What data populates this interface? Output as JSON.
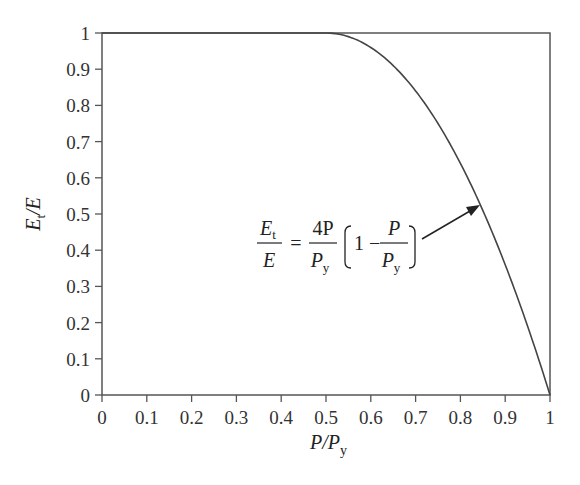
{
  "chart_data": {
    "type": "line",
    "title": "",
    "xlabel": "P/P_y",
    "ylabel": "E_t/E",
    "xlim": [
      0,
      1
    ],
    "ylim": [
      0,
      1
    ],
    "grid": false,
    "x_ticks": [
      "0",
      "0.1",
      "0.2",
      "0.3",
      "0.4",
      "0.5",
      "0.6",
      "0.7",
      "0.8",
      "0.9",
      "1"
    ],
    "y_ticks": [
      "0",
      "0.1",
      "0.2",
      "0.3",
      "0.4",
      "0.5",
      "0.6",
      "0.7",
      "0.8",
      "0.9",
      "1"
    ],
    "series": [
      {
        "name": "E_t/E",
        "x": [
          0,
          0.5,
          0.55,
          0.6,
          0.65,
          0.7,
          0.75,
          0.8,
          0.85,
          0.9,
          0.95,
          1.0
        ],
        "y": [
          1,
          1,
          0.99,
          0.96,
          0.91,
          0.84,
          0.75,
          0.64,
          0.51,
          0.36,
          0.19,
          0
        ]
      }
    ],
    "annotations": [
      {
        "text": "E_t/E = (4P/P_y)(1 - P/P_y)",
        "arrow_to": [
          0.84,
          0.54
        ]
      }
    ],
    "legend": null
  },
  "labels": {
    "xlabel_main": "P/P",
    "xlabel_sub": "y",
    "ylabel_main": "E",
    "ylabel_sub": "t",
    "ylabel_tail": "/E"
  },
  "formula": {
    "lhs_num": "E",
    "lhs_num_sub": "t",
    "lhs_den": "E",
    "equals": "=",
    "frac1_num": "4P",
    "frac1_den": "P",
    "frac1_den_sub": "y",
    "one_minus": "1 −",
    "frac2_num": "P",
    "frac2_den": "P",
    "frac2_den_sub": "y"
  }
}
